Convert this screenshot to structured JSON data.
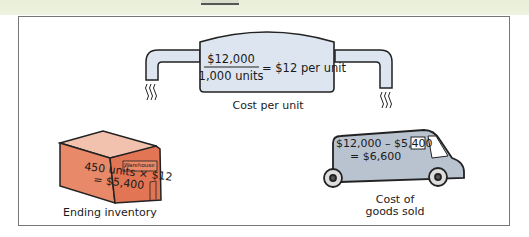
{
  "diagram": {
    "tank": {
      "numerator": "$12,000",
      "denominator": "1,000 units",
      "result": "= $12 per unit",
      "caption": "Cost per unit"
    },
    "warehouse": {
      "line1": "450 units × $12",
      "line2": "= $5,400",
      "sign": "Warehouse",
      "caption": "Ending inventory"
    },
    "truck": {
      "line1": "$12,000 – $5,400",
      "line2": "= $6,600",
      "caption_line1": "Cost of",
      "caption_line2": "goods sold"
    },
    "colors": {
      "tank_fill": "#dde6f0",
      "warehouse_fill": "#e8896a",
      "warehouse_roof": "#f2c2ae",
      "truck_fill": "#b9c3d0",
      "background_band": "#eaf0dc"
    }
  }
}
